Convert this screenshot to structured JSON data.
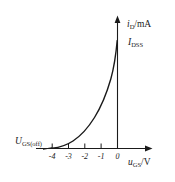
{
  "figure": {
    "name": "jfet-transfer-characteristic",
    "background_color": "#ffffff",
    "line_color": "#1a1a1a"
  },
  "labels": {
    "y_axis_symbol": "i",
    "y_axis_subscript": "D",
    "y_axis_unit": "/mA",
    "idss_symbol": "I",
    "idss_subscript": "DSS",
    "x_axis_symbol": "u",
    "x_axis_subscript": "GS",
    "x_axis_unit": "/V",
    "pinchoff_symbol": "U",
    "pinchoff_subscript": "GS(off)"
  },
  "chart_data": {
    "type": "line",
    "title": "",
    "xlabel": "u_GS/V",
    "ylabel": "i_D/mA",
    "xlim": [
      -4.4,
      0.6
    ],
    "ylim": [
      0,
      1.15
    ],
    "grid": false,
    "legend": null,
    "xticks": [
      -4,
      -3,
      -2,
      -1,
      0
    ],
    "xtick_labels": [
      "-4",
      "-3",
      "-2",
      "-1",
      "0"
    ],
    "yticks": [],
    "ytick_labels": [],
    "annotations": [
      {
        "text": "I_DSS",
        "x": 0.25,
        "y": 0.92
      },
      {
        "text": "U_GS(off)",
        "x": -4.0,
        "y": 0.12
      },
      {
        "text": "i_D/mA",
        "x": 0.3,
        "y": 1.1
      },
      {
        "text": "u_GS/V",
        "x": 0.35,
        "y": -0.12
      }
    ],
    "x": [
      -4.0,
      -3.75,
      -3.5,
      -3.25,
      -3.0,
      -2.75,
      -2.5,
      -2.25,
      -2.0,
      -1.75,
      -1.5,
      -1.25,
      -1.0,
      -0.75,
      -0.5,
      -0.25,
      0.0
    ],
    "y": [
      0.0,
      0.004,
      0.016,
      0.035,
      0.063,
      0.098,
      0.141,
      0.191,
      0.25,
      0.316,
      0.391,
      0.473,
      0.563,
      0.66,
      0.766,
      0.879,
      1.0
    ],
    "equation": "i_D = I_DSS * (1 - u_GS/U_GS(off))^2"
  }
}
